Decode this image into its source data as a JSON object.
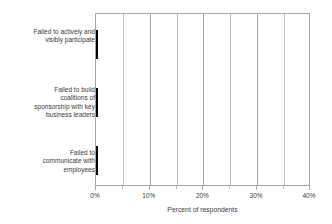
{
  "chart_data": {
    "type": "bar",
    "orientation": "horizontal",
    "title": "",
    "xlabel": "Percent of respondents",
    "ylabel": "",
    "categories": [
      "Failed to actively and visibly participate",
      "Failed to build coalitions of sponsorship with key business leaders",
      "Failed to communicate with employees"
    ],
    "category_lines": [
      [
        "Failed to actively and",
        "visibly participate"
      ],
      [
        "Failed to build",
        "coalitions of",
        "sponsorship with key",
        "business leaders"
      ],
      [
        "Failed to",
        "communicate with",
        "employees"
      ]
    ],
    "values": [
      20,
      26,
      30
    ],
    "value_labels": [
      "20%",
      "26%",
      "30%"
    ],
    "xlim": [
      0,
      40
    ],
    "xticks": [
      0,
      10,
      20,
      30,
      40
    ],
    "xtick_labels": [
      "0%",
      "10%",
      "20%",
      "30%",
      "40%"
    ],
    "minor_gridlines": [
      5,
      15,
      25,
      35
    ],
    "grid": true,
    "legend": false,
    "bar_color": "#000000",
    "grid_color": "#bfbfbf",
    "frame_color": "#a6a6a6",
    "text_color": "#3a3a3a"
  }
}
